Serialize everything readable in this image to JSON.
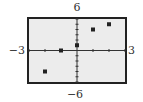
{
  "chart_data": {
    "type": "scatter",
    "title": "",
    "xlabel": "",
    "ylabel": "",
    "xlim": [
      -3,
      3
    ],
    "ylim": [
      -6,
      6
    ],
    "x_tick_step": 1,
    "y_tick_step": 1,
    "grid": false,
    "axes_visible": true,
    "marker": "square",
    "points": [
      {
        "x": -2,
        "y": -4
      },
      {
        "x": -1,
        "y": 0
      },
      {
        "x": 0,
        "y": 1
      },
      {
        "x": 1,
        "y": 4
      },
      {
        "x": 2,
        "y": 5
      }
    ],
    "window_labels": {
      "ymax": "6",
      "ymin": "−6",
      "xmin": "−3",
      "xmax": "3"
    }
  },
  "colors": {
    "frame": "#222222",
    "plot_background": "#ececec",
    "axis": "#333333",
    "marker": "#222222"
  }
}
